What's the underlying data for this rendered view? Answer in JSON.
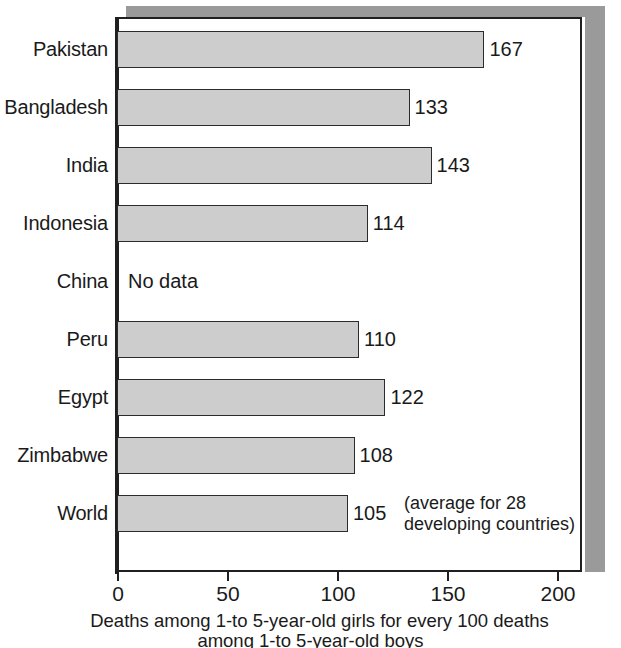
{
  "chart_data": {
    "type": "bar",
    "orientation": "horizontal",
    "title": "",
    "xlabel": "Deaths among 1-to 5-year-old girls for every 100 deaths among 1-to 5-year-old boys",
    "ylabel": "",
    "xlim": [
      0,
      225
    ],
    "xticks": [
      0,
      50,
      100,
      150,
      200
    ],
    "xtick_labels": [
      "0",
      "50",
      "100",
      "150",
      "200"
    ],
    "grid": false,
    "legend": null,
    "bar_color": "#cdcdcd",
    "bar_edge_color": "#2b2b2b",
    "categories": [
      "Pakistan",
      "Bangladesh",
      "India",
      "Indonesia",
      "China",
      "Peru",
      "Egypt",
      "Zimbabwe",
      "World"
    ],
    "values": [
      167,
      133,
      143,
      114,
      null,
      110,
      122,
      108,
      105
    ],
    "value_labels": [
      "167",
      "133",
      "143",
      "114",
      "",
      "110",
      "122",
      "108",
      "105"
    ],
    "missing_label": "No data",
    "annotations": [
      {
        "category": "World",
        "line1": "(average for 28",
        "line2": "developing countries)"
      }
    ]
  },
  "caption": {
    "line1": "Deaths among 1-to 5-year-old girls for every 100 deaths",
    "line2": "among 1-to 5-year-old boys"
  }
}
